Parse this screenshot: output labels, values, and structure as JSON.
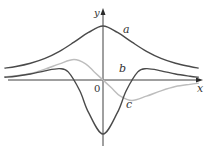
{
  "chart_data": {
    "type": "line",
    "title": "",
    "xlabel": "x",
    "ylabel": "y",
    "origin_label": "0",
    "grid": false,
    "legend": "inline-labels",
    "xlim": [
      -3.4,
      3.3
    ],
    "ylim": [
      -1.05,
      1.0
    ],
    "series": [
      {
        "name": "a",
        "label": "a",
        "description": "bell-shaped even curve, maximum at x = 0",
        "function": "1/(1+x^2)",
        "peak": 1.0,
        "color": "#4a4a4a",
        "x": [
          -3.4,
          -3,
          -2.5,
          -2,
          -1.5,
          -1,
          -0.5,
          0,
          0.5,
          1,
          1.5,
          2,
          2.5,
          3,
          3.3
        ],
        "y": [
          0.22,
          0.25,
          0.31,
          0.4,
          0.53,
          0.7,
          0.88,
          1.0,
          0.88,
          0.7,
          0.53,
          0.4,
          0.31,
          0.25,
          0.22
        ]
      },
      {
        "name": "b",
        "label": "b",
        "description": "even curve, deep minimum at x = 0, small maxima either side, tends to 0",
        "color": "#4a4a4a",
        "x": [
          -3.4,
          -3,
          -2.5,
          -2,
          -1.5,
          -1.2,
          -0.8,
          -0.5,
          0,
          0.5,
          0.8,
          1.2,
          1.5,
          2,
          2.5,
          3,
          3.3
        ],
        "y": [
          0.05,
          0.07,
          0.11,
          0.17,
          0.21,
          0.15,
          -0.2,
          -0.6,
          -1.0,
          -0.6,
          -0.2,
          0.15,
          0.21,
          0.17,
          0.11,
          0.07,
          0.05
        ]
      },
      {
        "name": "c",
        "label": "c",
        "description": "odd curve, maximum left of 0, passes through origin, minimum right of 0",
        "color": "#bdbdbd",
        "x": [
          -3.4,
          -3,
          -2.5,
          -2,
          -1.5,
          -1,
          -0.6,
          -0.3,
          0,
          0.3,
          0.6,
          1,
          1.5,
          2,
          2.5,
          3,
          3.3
        ],
        "y": [
          0.06,
          0.08,
          0.12,
          0.2,
          0.3,
          0.38,
          0.3,
          0.15,
          0.0,
          -0.15,
          -0.3,
          -0.38,
          -0.3,
          -0.2,
          -0.12,
          -0.08,
          -0.06
        ]
      }
    ]
  }
}
